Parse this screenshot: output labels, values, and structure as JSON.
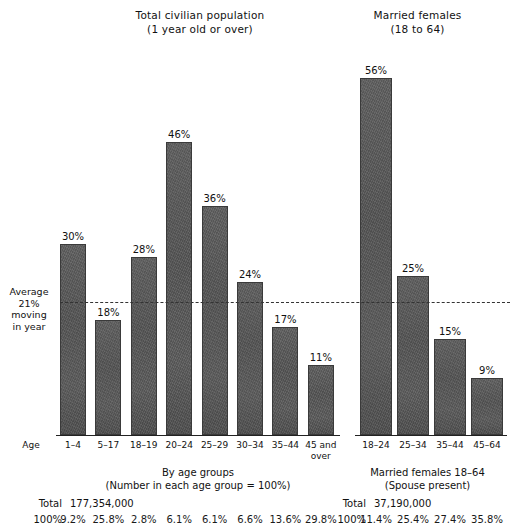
{
  "chart_data": {
    "type": "bar",
    "panels": [
      {
        "id": "total-civilian-population",
        "title_line1": "Total civilian population",
        "title_line2": "(1 year old or over)",
        "xlabel_line1": "By age groups",
        "xlabel_line2": "(Number in each age group = 100%)",
        "axis_word": "Age",
        "ylim": [
          0,
          50
        ],
        "categories": [
          "1–4",
          "5–17",
          "18–19",
          "20–24",
          "25–29",
          "30–34",
          "35–44",
          "45 and\nover"
        ],
        "values": [
          30,
          18,
          28,
          46,
          36,
          24,
          17,
          11
        ],
        "value_labels": [
          "30%",
          "18%",
          "28%",
          "46%",
          "36%",
          "24%",
          "17%",
          "11%"
        ],
        "total_label": "Total",
        "total_value": "177,354,000",
        "share_row_label": "100%",
        "share_values": [
          "9.2%",
          "25.8%",
          "2.8%",
          "6.1%",
          "6.1%",
          "6.6%",
          "13.6%",
          "29.8%"
        ]
      },
      {
        "id": "married-females",
        "title_line1": "Married females",
        "title_line2": "(18 to 64)",
        "xlabel_line1": "Married females 18–64",
        "xlabel_line2": "(Spouse present)",
        "ylim": [
          0,
          60
        ],
        "categories": [
          "18–24",
          "25–34",
          "35–44",
          "45–64"
        ],
        "values": [
          56,
          25,
          15,
          9
        ],
        "value_labels": [
          "56%",
          "25%",
          "15%",
          "9%"
        ],
        "total_label": "Total",
        "total_value": "37,190,000",
        "share_row_label": "100%",
        "share_values": [
          "11.4%",
          "25.4%",
          "27.4%",
          "35.8%"
        ]
      }
    ],
    "reference_line": {
      "value": 21,
      "note_line1": "Average",
      "note_line2": "21%",
      "note_line3": "moving",
      "note_line4": "in year",
      "style": "dashed"
    },
    "colors": {
      "bar": "#595959",
      "bar_border": "#3a3a3a",
      "axis": "#222222",
      "text": "#111111",
      "background": "#ffffff"
    },
    "grid": false,
    "legend": "none"
  }
}
